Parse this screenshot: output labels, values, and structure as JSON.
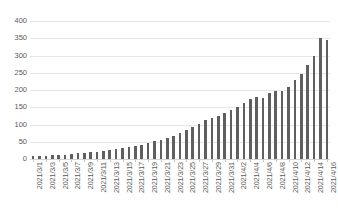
{
  "chart_data": {
    "type": "bar",
    "title": "",
    "subtitle": "",
    "xlabel": "",
    "ylabel": "",
    "ylim": [
      0,
      400
    ],
    "y_ticks": [
      0,
      50,
      100,
      150,
      200,
      250,
      300,
      350,
      400
    ],
    "grid": true,
    "legend": false,
    "legend_position": "none",
    "bar_color": "#5f5f5f",
    "gridline_color": "#e6e6e6",
    "tick_label_color": "#5a5a5a",
    "x_tick_rotation": -90,
    "x_tick_interval": 2,
    "categories": [
      "2021/3/1",
      "2021/3/2",
      "2021/3/3",
      "2021/3/4",
      "2021/3/5",
      "2021/3/6",
      "2021/3/7",
      "2021/3/8",
      "2021/3/9",
      "2021/3/10",
      "2021/3/11",
      "2021/3/12",
      "2021/3/13",
      "2021/3/14",
      "2021/3/15",
      "2021/3/16",
      "2021/3/17",
      "2021/3/18",
      "2021/3/19",
      "2021/3/20",
      "2021/3/21",
      "2021/3/22",
      "2021/3/23",
      "2021/3/24",
      "2021/3/25",
      "2021/3/26",
      "2021/3/27",
      "2021/3/28",
      "2021/3/29",
      "2021/3/30",
      "2021/3/31",
      "2021/4/1",
      "2021/4/2",
      "2021/4/3",
      "2021/4/4",
      "2021/4/5",
      "2021/4/6",
      "2021/4/7",
      "2021/4/8",
      "2021/4/9",
      "2021/4/10",
      "2021/4/11",
      "2021/4/12",
      "2021/4/13",
      "2021/4/14",
      "2021/4/15",
      "2021/4/16"
    ],
    "x_tick_labels": [
      "2021/3/1",
      "2021/3/3",
      "2021/3/5",
      "2021/3/7",
      "2021/3/9",
      "2021/3/11",
      "2021/3/13",
      "2021/3/15",
      "2021/3/17",
      "2021/3/19",
      "2021/3/21",
      "2021/3/23",
      "2021/3/25",
      "2021/3/27",
      "2021/3/29",
      "2021/3/31",
      "2021/4/2",
      "2021/4/4",
      "2021/4/6",
      "2021/4/8",
      "2021/4/10",
      "2021/4/12",
      "2021/4/14",
      "2021/4/16"
    ],
    "values": [
      8,
      9,
      10,
      11,
      12,
      13,
      14,
      16,
      17,
      19,
      21,
      23,
      26,
      28,
      31,
      34,
      38,
      42,
      46,
      51,
      56,
      62,
      68,
      75,
      83,
      92,
      101,
      112,
      118,
      126,
      134,
      143,
      152,
      163,
      175,
      180,
      178,
      190,
      196,
      198,
      210,
      228,
      246,
      272,
      300,
      352,
      346
    ]
  }
}
